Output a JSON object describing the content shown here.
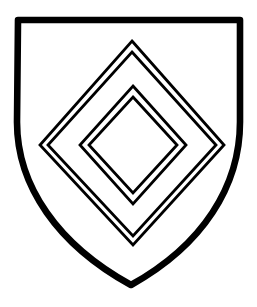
{
  "image": {
    "title": "Heraldic shield with two voided lozenges",
    "subject": "escutcheon",
    "style": "black ink line drawing",
    "background_color": "#FFFFFF",
    "ink_color": "#000000",
    "width": 257,
    "height": 307
  },
  "shield": {
    "name": "escutcheon-outline",
    "description": "Heater-shape shield with flat top, straight upper sides, curved lower sides meeting at a point",
    "stroke_color": "#000000",
    "fill_color": "#FFFFFF",
    "stroke_width": 6,
    "geometry": {
      "top_left": [
        15,
        17
      ],
      "top_right": [
        243,
        17
      ],
      "bottom_point": [
        131,
        288
      ],
      "right_straight_to": [
        240,
        120
      ],
      "left_straight_to": [
        17,
        120
      ]
    }
  },
  "charges": [
    {
      "name": "outer-lozenge",
      "label": "Outer voided lozenge",
      "shape": "lozenge",
      "line_style": "double-line",
      "stroke_color": "#000000",
      "stroke_width": 2.6,
      "center": [
        132,
        143
      ],
      "points": {
        "top": [
          132,
          41
        ],
        "right": [
          224,
          145
        ],
        "bottom": [
          133,
          245
        ],
        "left": [
          40,
          145
        ]
      },
      "outer_offset": 0,
      "inner_offset": 6
    },
    {
      "name": "inner-lozenge",
      "label": "Inner voided lozenge",
      "shape": "lozenge",
      "line_style": "double-line",
      "stroke_color": "#000000",
      "stroke_width": 2.6,
      "center": [
        133,
        145
      ],
      "points": {
        "top": [
          133,
          86
        ],
        "right": [
          186,
          145
        ],
        "bottom": [
          133,
          204
        ],
        "left": [
          80,
          145
        ]
      },
      "outer_offset": 0,
      "inner_offset": 6
    }
  ],
  "field": {
    "name": "shield-field",
    "tincture_label": "plain (white / argent)",
    "fill_color": "#FFFFFF"
  }
}
